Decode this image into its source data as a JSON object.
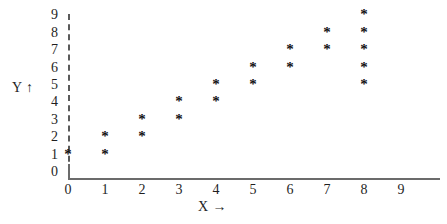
{
  "chart_data": {
    "type": "scatter",
    "title": "",
    "xlabel": "X →",
    "ylabel": "Y ↑",
    "xlim": [
      0,
      9
    ],
    "ylim": [
      0,
      9
    ],
    "grid": false,
    "legend": null,
    "marker": "*",
    "marker_color": "#111111",
    "axis_color": "#6b6b6b",
    "y_axis_style": "dashed",
    "x_axis_style": "solid",
    "xticks": [
      "0",
      "1",
      "2",
      "3",
      "4",
      "5",
      "6",
      "7",
      "8",
      "9"
    ],
    "yticks": [
      "0",
      "1",
      "2",
      "3",
      "4",
      "5",
      "6",
      "7",
      "8",
      "9"
    ],
    "x": [
      0,
      1,
      1,
      2,
      2,
      3,
      3,
      4,
      4,
      5,
      5,
      6,
      6,
      7,
      7,
      8,
      8,
      8,
      8,
      8
    ],
    "y": [
      1,
      1,
      2,
      2,
      3,
      3,
      4,
      4,
      5,
      5,
      6,
      6,
      7,
      7,
      8,
      5,
      6,
      7,
      8,
      9
    ],
    "points": [
      {
        "x": 0,
        "y": 1
      },
      {
        "x": 1,
        "y": 1
      },
      {
        "x": 1,
        "y": 2
      },
      {
        "x": 2,
        "y": 2
      },
      {
        "x": 2,
        "y": 3
      },
      {
        "x": 3,
        "y": 3
      },
      {
        "x": 3,
        "y": 4
      },
      {
        "x": 4,
        "y": 4
      },
      {
        "x": 4,
        "y": 5
      },
      {
        "x": 5,
        "y": 5
      },
      {
        "x": 5,
        "y": 6
      },
      {
        "x": 6,
        "y": 6
      },
      {
        "x": 6,
        "y": 7
      },
      {
        "x": 7,
        "y": 7
      },
      {
        "x": 7,
        "y": 8
      },
      {
        "x": 8,
        "y": 5
      },
      {
        "x": 8,
        "y": 6
      },
      {
        "x": 8,
        "y": 7
      },
      {
        "x": 8,
        "y": 8
      },
      {
        "x": 8,
        "y": 9
      }
    ]
  },
  "axis_titles": {
    "y": "Y ↑",
    "x": "X →"
  }
}
